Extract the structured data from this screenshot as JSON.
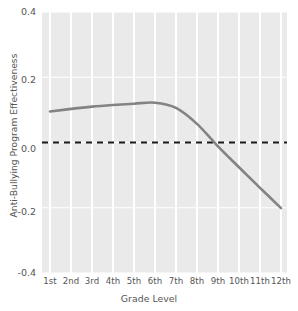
{
  "chart_data": {
    "type": "line",
    "title": "",
    "xlabel": "Grade Level",
    "ylabel": "Anti-Bullying Program Effectiveness",
    "categories": [
      "1st",
      "2nd",
      "3rd",
      "4th",
      "5th",
      "6th",
      "7th",
      "8th",
      "9th",
      "10th",
      "11th",
      "12th"
    ],
    "values": [
      0.095,
      0.103,
      0.11,
      0.115,
      0.119,
      0.122,
      0.106,
      0.057,
      -0.012,
      -0.076,
      -0.139,
      -0.201
    ],
    "series": [
      {
        "name": "Anti-Bullying Program Effectiveness",
        "values": [
          0.095,
          0.103,
          0.11,
          0.115,
          0.119,
          0.122,
          0.106,
          0.057,
          -0.012,
          -0.076,
          -0.139,
          -0.201
        ]
      }
    ],
    "ylim": [
      -0.4,
      0.4
    ],
    "yticks": [
      0.4,
      0.2,
      0.0,
      -0.2,
      -0.4
    ],
    "ytick_labels": [
      "0.4",
      "0.2",
      "0.0",
      "-0.2",
      "-0.4"
    ],
    "xtick_labels": [
      "1st",
      "2nd",
      "3rd",
      "4th",
      "5th",
      "6th",
      "7th",
      "8th",
      "9th",
      "10th",
      "11th",
      "12th"
    ],
    "grid": true,
    "grid_color": "#ffffff",
    "panel_background": "#eaeaea",
    "legend": null,
    "legend_position": "none",
    "line_color": "#838383",
    "annotations": [
      {
        "name": "zero-reference-line",
        "type": "hline",
        "value": 0.0,
        "style": "dashed",
        "color": "#1a1a1a"
      }
    ]
  },
  "axes": {
    "x_title": "Grade Level",
    "y_title": "Anti-Bullying Program Effectiveness"
  }
}
